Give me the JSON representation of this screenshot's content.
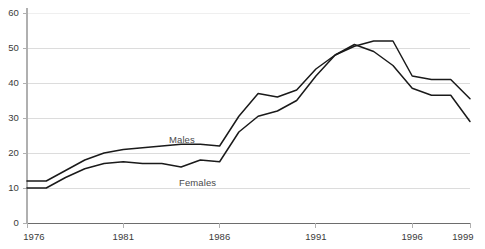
{
  "chart_data": {
    "type": "line",
    "title": "",
    "subtitle": "",
    "xlabel": "",
    "ylabel": "",
    "xlim": [
      1976,
      1999
    ],
    "ylim": [
      0,
      60
    ],
    "grid": true,
    "legend_position": "inline-annotations",
    "y_ticks": [
      0,
      10,
      20,
      30,
      40,
      50,
      60
    ],
    "y_tick_labels": [
      "0",
      "10",
      "20",
      "30",
      "40",
      "50",
      "60"
    ],
    "x_ticks": [
      1976,
      1981,
      1986,
      1991,
      1996,
      1999
    ],
    "x_tick_labels": [
      "1976",
      "1981",
      "1986",
      "1991",
      "1996",
      "1999"
    ],
    "x": [
      1976,
      1977,
      1978,
      1979,
      1980,
      1981,
      1982,
      1983,
      1984,
      1985,
      1986,
      1987,
      1988,
      1989,
      1990,
      1991,
      1992,
      1993,
      1994,
      1995,
      1996,
      1997,
      1998,
      1999
    ],
    "series": [
      {
        "name": "Males",
        "color": "#1a1a1a",
        "annotation": "Males",
        "values": [
          12,
          12,
          15,
          18,
          20,
          21,
          21.5,
          22,
          22.5,
          22.5,
          22,
          30.5,
          37,
          36,
          38,
          44,
          48,
          50.5,
          52,
          52,
          42,
          41,
          41,
          35.5
        ]
      },
      {
        "name": "Females",
        "color": "#1a1a1a",
        "annotation": "Females",
        "values": [
          10,
          10,
          13,
          15.5,
          17,
          17.5,
          17,
          17,
          16,
          18,
          17.5,
          26,
          30.5,
          32,
          35,
          42,
          48,
          51,
          49,
          45,
          38.5,
          36.5,
          36.5,
          29
        ]
      }
    ],
    "colors": {
      "line": "#1a1a1a",
      "axis": "#b0b0b0",
      "grid": "#dcdcdc",
      "tick_text": "#3a3a3a",
      "background": "#ffffff"
    }
  }
}
